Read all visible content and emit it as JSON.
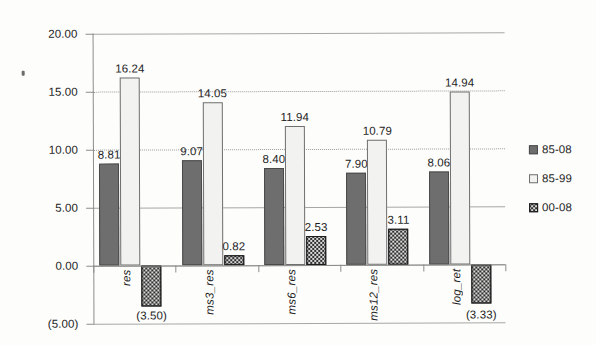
{
  "chart_data": {
    "type": "bar",
    "title": "",
    "xlabel": "",
    "ylabel": "",
    "grid": true,
    "legend_position": "right",
    "ylim": [
      -5.0,
      20.0
    ],
    "ytick_values": [
      20.0,
      15.0,
      10.0,
      5.0,
      0.0,
      -5.0
    ],
    "ytick_labels": [
      "20.00",
      "15.00",
      "10.00",
      "5.00",
      "0.00",
      "(5.00)"
    ],
    "categories": [
      "res",
      "ms3_res",
      "ms6_res",
      "ms12_res",
      "log_ret"
    ],
    "series": [
      {
        "name": "85-08",
        "color": "#6e6e6e",
        "values": [
          8.81,
          9.07,
          8.4,
          7.9,
          8.06
        ],
        "labels": [
          "8.81",
          "9.07",
          "8.40",
          "7.90",
          "8.06"
        ]
      },
      {
        "name": "85-99",
        "color": "#f2f2f0",
        "values": [
          16.24,
          14.05,
          11.94,
          10.79,
          14.94
        ],
        "labels": [
          "16.24",
          "14.05",
          "11.94",
          "10.79",
          "14.94"
        ]
      },
      {
        "name": "00-08",
        "color": "#2f2f2f",
        "values": [
          -3.5,
          0.82,
          2.53,
          3.11,
          -3.33
        ],
        "labels": [
          "(3.50)",
          "0.82",
          "2.53",
          "3.11",
          "(3.33)"
        ]
      }
    ]
  },
  "legend": {
    "items": [
      {
        "label": "85-08",
        "swatch": "series-0-swatch"
      },
      {
        "label": "85-99",
        "swatch": "series-1-swatch"
      },
      {
        "label": "00-08",
        "swatch": "series-2-swatch"
      }
    ]
  }
}
